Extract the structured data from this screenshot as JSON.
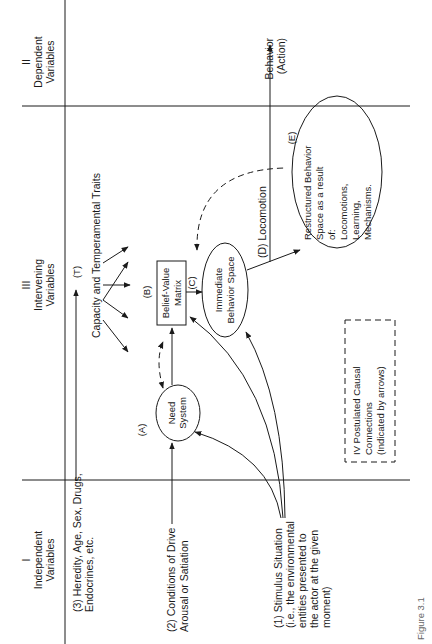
{
  "sections": {
    "independent": {
      "numeral": "I",
      "line1": "Independent",
      "line2": "Variables"
    },
    "intervening": {
      "numeral": "III",
      "line1": "Intervening",
      "line2": "Variables"
    },
    "dependent": {
      "numeral": "II",
      "line1": "Dependent",
      "line2": "Variables"
    }
  },
  "inputs": {
    "heredity": {
      "line1": "(3) Heredity, Age, Sex, Drugs,",
      "line2": "Endocrines, etc."
    },
    "drive": {
      "line1": "(2) Conditions of Drive",
      "line2": "Arousal or Satiation"
    },
    "stimulus": {
      "line1": "(1) Stimulus Situation",
      "line2": "(i.e., the environmental",
      "line3": "entities presented to",
      "line4": "the actor at the given",
      "line5": "moment)"
    }
  },
  "nodes": {
    "traits_label": "(T)",
    "traits": "Capacity and Temperamental Traits",
    "need_label": "(A)",
    "need": {
      "line1": "Need",
      "line2": "System"
    },
    "belief_label": "(B)",
    "belief": {
      "line1": "Belief-Value",
      "line2": "Matrix"
    },
    "immediate_label": "(C)",
    "immediate": {
      "line1": "Immediate",
      "line2": "Behavior Space"
    },
    "locomotion": "(D) Locomotion",
    "restructured_label": "(E)",
    "restructured": {
      "line1": "Restructured Behavior",
      "line2": "Space as a result",
      "line3": "of:",
      "line4": "Locomotions,",
      "line5": "Learning,",
      "line6": "Mechanisms."
    }
  },
  "output": {
    "line1": "Behavior",
    "line2": "(Action)"
  },
  "legend": {
    "line1": "IV Postulated Causal",
    "line2": "Connections",
    "line3": "(Indicated by arrows)"
  },
  "caption": "Figure 3.1"
}
